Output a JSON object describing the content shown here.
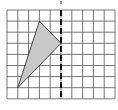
{
  "figure": {
    "type": "grid-reflection-diagram",
    "grid": {
      "columns": 10,
      "rows": 8,
      "origin_px": [
        7,
        10
      ],
      "cell_w": 10.8,
      "cell_h": 11.1,
      "line_color": "#555555"
    },
    "mirror_line": {
      "orientation": "vertical",
      "grid_x": 5,
      "style": "dashed",
      "color": "#111111"
    },
    "triangle": {
      "vertices_grid": [
        [
          3,
          1
        ],
        [
          5,
          3
        ],
        [
          1,
          7
        ]
      ],
      "fill": "#c8c8c8",
      "stroke": "#222222"
    },
    "top_mark": {
      "grid_x": 5,
      "color": "#333333"
    }
  }
}
